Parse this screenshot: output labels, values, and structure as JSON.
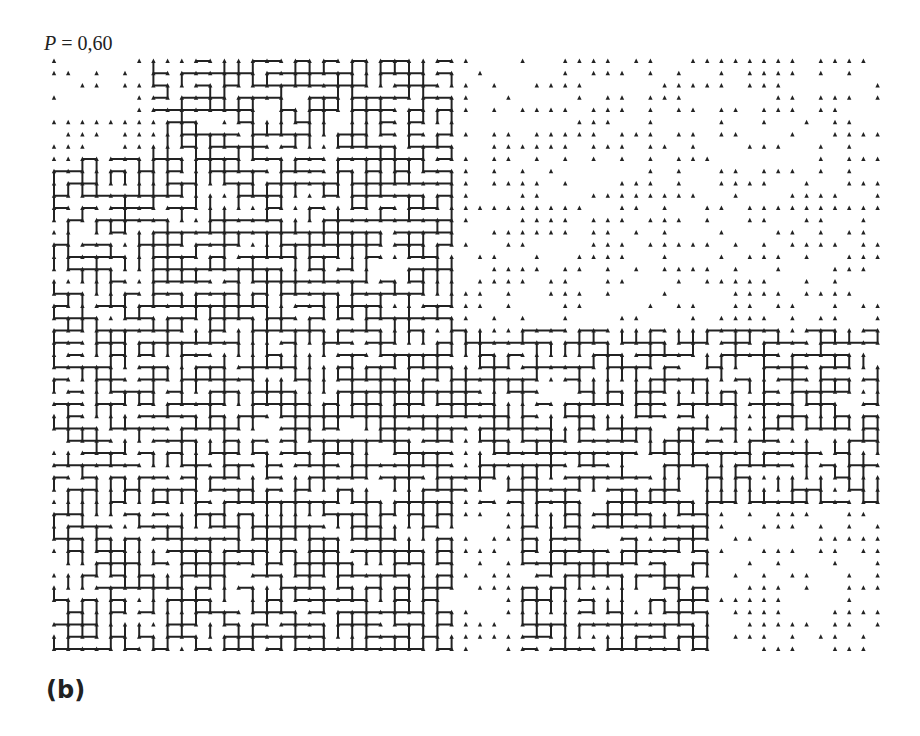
{
  "figure": {
    "label_var": "P",
    "label_eq": " = 0,60",
    "caption": "(b)",
    "ink_color": "#222222",
    "background": "#ffffff"
  },
  "lattice": {
    "origin_x": 54,
    "origin_y": 61,
    "spacing_x": 14.2,
    "spacing_y": 12.25,
    "cols": 59,
    "rows": 49,
    "probability": 0.6,
    "site_glyph": "arrowhead-up",
    "dense_regions": [
      {
        "c0": 7,
        "c1": 28,
        "r0": 0,
        "r1": 48,
        "density": 0.62
      },
      {
        "c0": 0,
        "c1": 8,
        "r0": 8,
        "r1": 48,
        "density": 0.55
      },
      {
        "c0": 25,
        "c1": 58,
        "r0": 22,
        "r1": 36,
        "density": 0.58
      },
      {
        "c0": 33,
        "c1": 46,
        "r0": 33,
        "r1": 48,
        "density": 0.56
      },
      {
        "c0": 15,
        "c1": 28,
        "r0": 0,
        "r1": 4,
        "density": 0.6
      }
    ],
    "sparse_site_density": 0.55
  }
}
